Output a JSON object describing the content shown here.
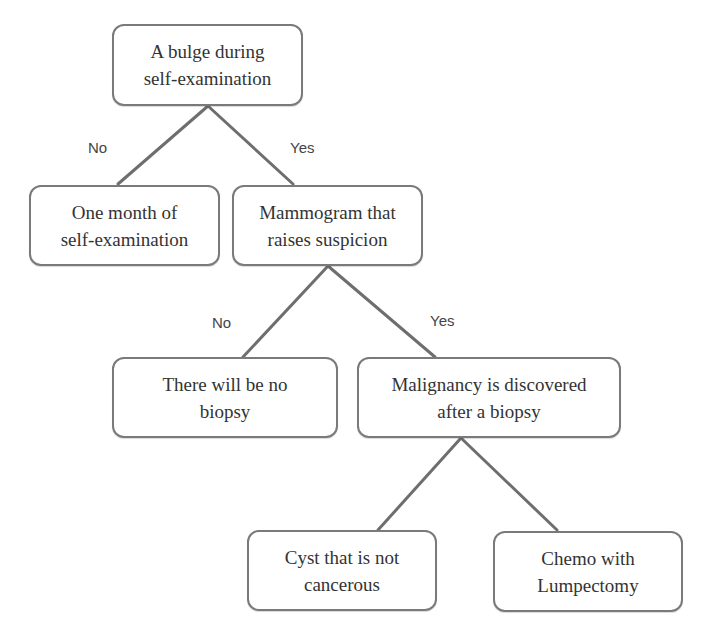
{
  "diagram": {
    "type": "decision-tree",
    "nodes": {
      "root": {
        "line1": "A bulge during",
        "line2": "self-examination"
      },
      "no_lump": {
        "line1": "One month of",
        "line2": "self-examination"
      },
      "mammogram": {
        "line1": "Mammogram that",
        "line2": "raises suspicion"
      },
      "no_biopsy": {
        "line1": "There will be no",
        "line2": "biopsy"
      },
      "malignancy": {
        "line1": "Malignancy is discovered",
        "line2": "after a biopsy"
      },
      "cyst": {
        "line1": "Cyst that is not",
        "line2": "cancerous"
      },
      "chemo": {
        "line1": "Chemo with",
        "line2": "Lumpectomy"
      }
    },
    "edges": [
      {
        "from": "root",
        "to": "no_lump",
        "label": "No"
      },
      {
        "from": "root",
        "to": "mammogram",
        "label": "Yes"
      },
      {
        "from": "mammogram",
        "to": "no_biopsy",
        "label": "No"
      },
      {
        "from": "mammogram",
        "to": "malignancy",
        "label": "Yes"
      },
      {
        "from": "malignancy",
        "to": "cyst",
        "label": ""
      },
      {
        "from": "malignancy",
        "to": "chemo",
        "label": ""
      }
    ],
    "colors": {
      "border": "#7a7a7a",
      "line": "#6e6e6e",
      "text": "#333333"
    }
  }
}
